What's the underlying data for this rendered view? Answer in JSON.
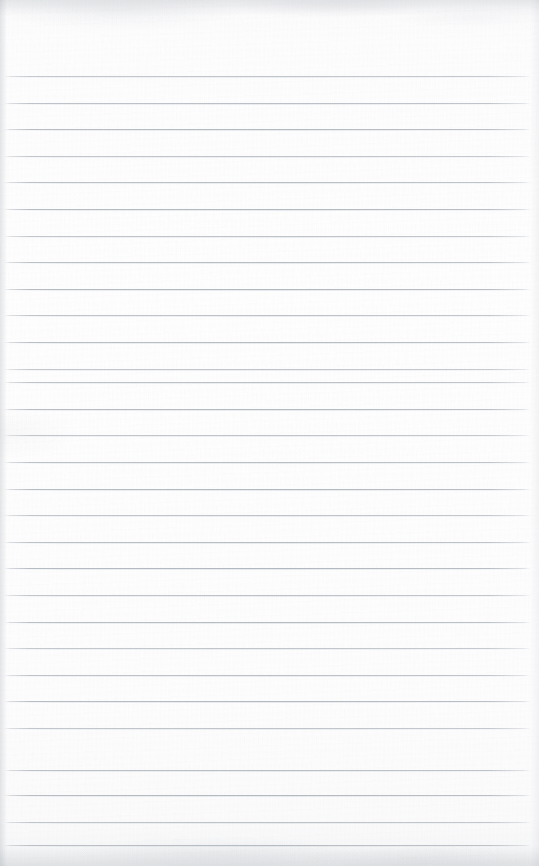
{
  "document": {
    "kind": "scanned-lined-paper",
    "title": "Blank Lined Notebook Page",
    "page_width": 539,
    "page_height": 866,
    "paper_color": "#fdfdfe",
    "rule_color": "#b2b8bf",
    "text_content": "",
    "has_handwriting": false,
    "has_printed_text": false
  },
  "ruling": {
    "line_count": 29,
    "first_line_y": 76,
    "line_spacing": 26.6,
    "last_line_y": 845,
    "line_thickness": 1,
    "line_start_x": 4,
    "line_end_x": 531,
    "top_margin": 76,
    "bottom_margin": 21,
    "margin_rule": "none",
    "lines_y": [
      76,
      103,
      129,
      156,
      182,
      209,
      236,
      262,
      289,
      315,
      342,
      369,
      382,
      409,
      435,
      462,
      489,
      515,
      542,
      568,
      595,
      622,
      648,
      675,
      701,
      728,
      770,
      795,
      822,
      845
    ]
  },
  "edges": {
    "left_vignette_color": "#8a9098",
    "top_vignette_color": "#8c929a",
    "bottom_vignette_color": "#8c929a",
    "right_vignette_color": "#969ca4"
  }
}
